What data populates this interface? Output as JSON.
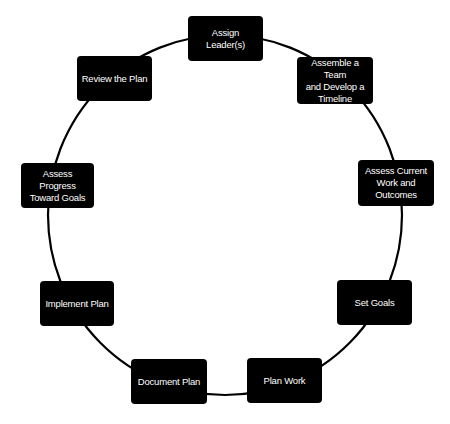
{
  "diagram": {
    "type": "cycle",
    "background": "#ffffff",
    "node_color": "#000000",
    "text_color": "#ffffff",
    "line_color": "#000000",
    "nodes": [
      {
        "id": "assign-leaders",
        "label": "Assign\nLeader(s)"
      },
      {
        "id": "assemble-team",
        "label": "Assemble a Team\nand Develop a\nTimeline"
      },
      {
        "id": "assess-current",
        "label": "Assess Current\nWork and\nOutcomes"
      },
      {
        "id": "set-goals",
        "label": "Set Goals"
      },
      {
        "id": "plan-work",
        "label": "Plan Work"
      },
      {
        "id": "document-plan",
        "label": "Document Plan"
      },
      {
        "id": "implement-plan",
        "label": "Implement Plan"
      },
      {
        "id": "assess-progress",
        "label": "Assess Progress\nToward Goals"
      },
      {
        "id": "review-plan",
        "label": "Review the Plan"
      }
    ]
  }
}
